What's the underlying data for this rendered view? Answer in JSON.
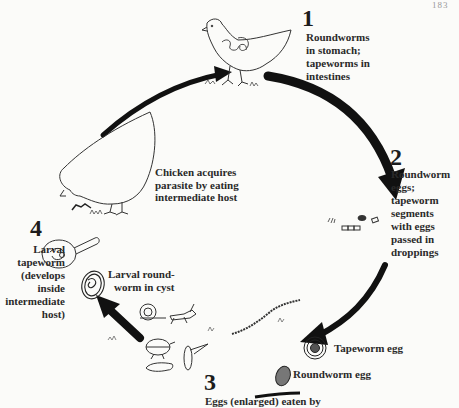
{
  "page": {
    "number": "183"
  },
  "steps": [
    {
      "number": "1",
      "text_lines": [
        "Roundworms",
        "in stomach;",
        "tapeworms in",
        "intestines"
      ]
    },
    {
      "number": "2",
      "text_lines": [
        "Roundworm",
        "eggs;",
        "tapeworm",
        "segments",
        "with eggs",
        "passed in",
        "droppings"
      ]
    },
    {
      "number": "3",
      "text_lines": [
        "Eggs (enlarged) eaten by"
      ]
    },
    {
      "number": "4",
      "text_lines": [
        "Larval",
        "tapeworm",
        "(develops",
        "inside",
        "intermediate",
        "host)"
      ]
    }
  ],
  "annotations": {
    "chicken_acquires": [
      "Chicken acquires",
      "parasite by eating",
      "intermediate host"
    ],
    "larval_roundworm": [
      "Larval round-",
      "worm in cyst"
    ],
    "tapeworm_egg": "Tapeworm egg",
    "roundworm_egg": "Roundworm egg"
  },
  "colors": {
    "ink": "#1a1a1a",
    "paper": "#fbfbf9"
  }
}
